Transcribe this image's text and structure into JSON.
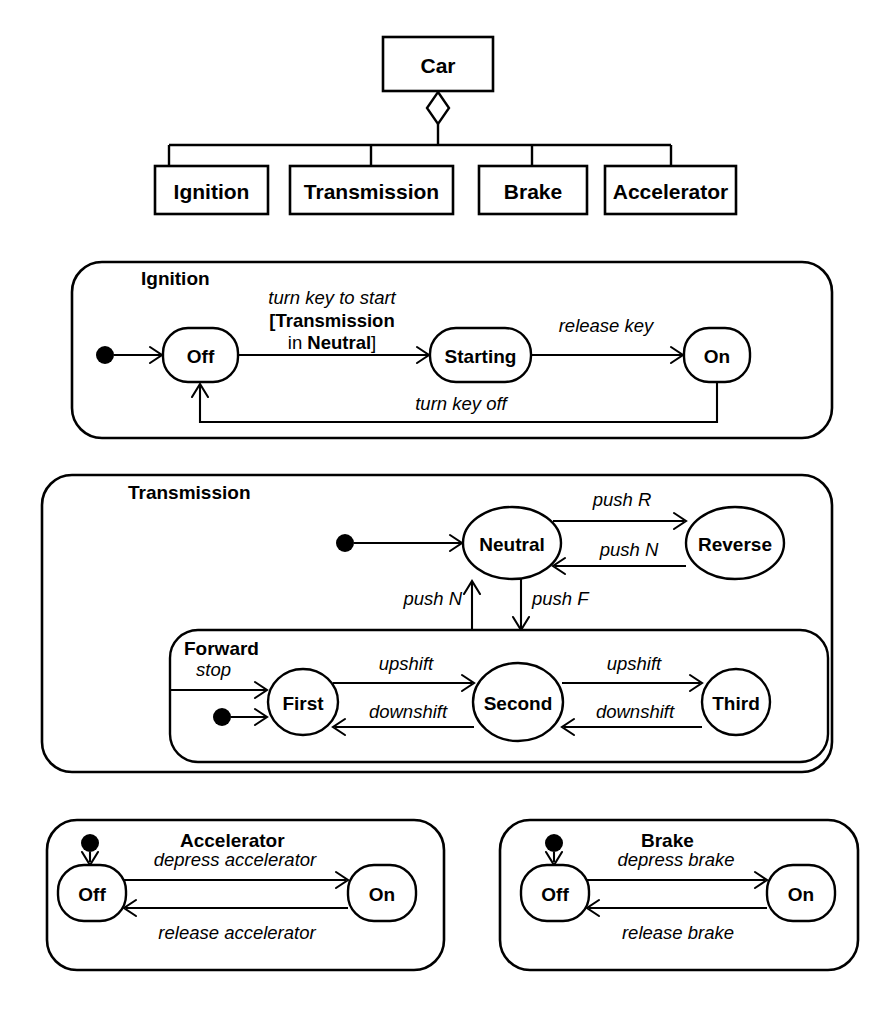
{
  "diagram": {
    "accent_color": "#000000",
    "background_color": "#ffffff"
  },
  "class_diagram": {
    "parent": {
      "label": "Car"
    },
    "aggregation_marker": "diamond",
    "parts": [
      {
        "label": "Ignition"
      },
      {
        "label": "Transmission"
      },
      {
        "label": "Brake"
      },
      {
        "label": "Accelerator"
      }
    ]
  },
  "regions": {
    "ignition": {
      "title": "Ignition",
      "states": [
        {
          "label": "Off"
        },
        {
          "label": "Starting"
        },
        {
          "label": "On"
        }
      ],
      "initial_marker": "filled-circle",
      "transitions": [
        {
          "label": "turn key to start",
          "guard_line1": "[Transmission",
          "guard_line2_prefix": "in ",
          "guard_line2_bold": "Neutral",
          "guard_line2_suffix": "]",
          "from": "Off",
          "to": "Starting"
        },
        {
          "label": "release key",
          "from": "Starting",
          "to": "On"
        },
        {
          "label": "turn key off",
          "from": "On",
          "to": "Off"
        }
      ]
    },
    "transmission": {
      "title": "Transmission",
      "states": [
        {
          "label": "Neutral"
        },
        {
          "label": "Reverse"
        }
      ],
      "initial_marker": "filled-circle",
      "transitions": [
        {
          "label": "push R",
          "from": "Neutral",
          "to": "Reverse"
        },
        {
          "label": "push N",
          "from": "Reverse",
          "to": "Neutral"
        },
        {
          "label": "push F",
          "from": "Neutral",
          "to": "Forward"
        },
        {
          "label": "push N",
          "from": "Forward",
          "to": "Neutral"
        }
      ],
      "forward": {
        "title": "Forward",
        "states": [
          {
            "label": "First"
          },
          {
            "label": "Second"
          },
          {
            "label": "Third"
          }
        ],
        "initial_marker": "filled-circle",
        "entry_label": "stop",
        "transitions": [
          {
            "label": "upshift",
            "from": "First",
            "to": "Second"
          },
          {
            "label": "upshift",
            "from": "Second",
            "to": "Third"
          },
          {
            "label": "downshift",
            "from": "Second",
            "to": "First"
          },
          {
            "label": "downshift",
            "from": "Third",
            "to": "Second"
          }
        ]
      }
    },
    "accelerator": {
      "title": "Accelerator",
      "states": [
        {
          "label": "Off"
        },
        {
          "label": "On"
        }
      ],
      "initial_marker": "filled-circle",
      "transitions": [
        {
          "label": "depress accelerator",
          "from": "Off",
          "to": "On"
        },
        {
          "label": "release accelerator",
          "from": "On",
          "to": "Off"
        }
      ]
    },
    "brake": {
      "title": "Brake",
      "states": [
        {
          "label": "Off"
        },
        {
          "label": "On"
        }
      ],
      "initial_marker": "filled-circle",
      "transitions": [
        {
          "label": "depress brake",
          "from": "Off",
          "to": "On"
        },
        {
          "label": "release brake",
          "from": "On",
          "to": "Off"
        }
      ]
    }
  }
}
